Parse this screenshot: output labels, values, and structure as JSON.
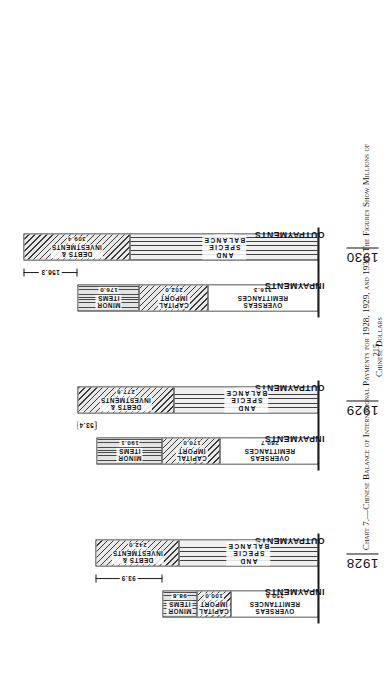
{
  "page": {
    "folio": "215",
    "caption_line1": "Chart 7.—Chinese Balance of International Payments for 1928, 1929, and 1930.  The Figures Show Millions of",
    "caption_line2": "Chinese Dollars"
  },
  "axis": {
    "inpayments_label": "INPAYMENTS",
    "outpayments_label": "OUTPAYMENTS"
  },
  "chart_data": {
    "type": "bar",
    "title": "Chinese Balance of International Payments for 1928, 1929, and 1930.  The Figures Show Millions of Chinese Dollars",
    "units": "Millions of Chinese Dollars",
    "xlabel": "",
    "ylabel": "",
    "grid": false,
    "legend": "none",
    "categories": [
      "1928",
      "1929",
      "1930"
    ],
    "groups": [
      {
        "year": "1928",
        "inpayments": {
          "label": "INPAYMENTS",
          "total": 450.2,
          "segments": [
            {
              "name": "OVERSEAS\nREMITTANCES",
              "value": "250.6",
              "amount": 250.6,
              "fill": "blank"
            },
            {
              "name": "CAPITAL\nIMPORT",
              "value": "100.0",
              "amount": 100.0,
              "fill": "hatch"
            },
            {
              "name": "MINOR\nITEMS",
              "value": "98.8",
              "amount": 98.8,
              "fill": "horz"
            }
          ]
        },
        "outpayments": {
          "label": "OUTPAYMENTS",
          "total": 643.3,
          "segments": [
            {
              "name": "TRADE AND SPECIE BALANCE",
              "value": "401.3",
              "amount": 401.3,
              "fill": "vert"
            },
            {
              "name": "DEBTS & INVESTMENTS",
              "value": "242.0",
              "amount": 242.0,
              "fill": "hatch"
            }
          ]
        },
        "deficit": "93.9"
      },
      {
        "year": "1929",
        "inpayments": {
          "label": "INPAYMENTS",
          "total": 640.8,
          "segments": [
            {
              "name": "OVERSEAS\nREMITTANCES",
              "value": "280.7",
              "amount": 280.7,
              "fill": "blank"
            },
            {
              "name": "CAPITAL\nIMPORT",
              "value": "170.0",
              "amount": 170.0,
              "fill": "hatch"
            },
            {
              "name": "MINOR\nITEMS",
              "value": "190.1",
              "amount": 190.1,
              "fill": "horz"
            }
          ]
        },
        "outpayments": {
          "label": "OUTPAYMENTS",
          "total": 694.2,
          "segments": [
            {
              "name": "TRADE AND SPECIE BALANCE",
              "value": "416.6",
              "amount": 416.6,
              "fill": "vert"
            },
            {
              "name": "DEBTS & INVESTMENTS",
              "value": "277.6",
              "amount": 277.6,
              "fill": "hatch"
            }
          ]
        },
        "deficit": "53.4"
      },
      {
        "year": "1930",
        "inpayments": {
          "label": "INPAYMENTS",
          "total": 694.3,
          "segments": [
            {
              "name": "OVERSEAS\nREMITTANCES",
              "value": "316.3",
              "amount": 316.3,
              "fill": "blank"
            },
            {
              "name": "CAPITAL\nIMPORT",
              "value": "202.0",
              "amount": 202.0,
              "fill": "hatch"
            },
            {
              "name": "MINOR\nITEMS",
              "value": "176.0",
              "amount": 176.0,
              "fill": "horz"
            }
          ]
        },
        "outpayments": {
          "label": "OUTPAYMENTS",
          "total": 850.6,
          "segments": [
            {
              "name": "TRADE AND SPECIE BALANCE",
              "value": "541.2",
              "amount": 541.2,
              "fill": "vert"
            },
            {
              "name": "DEBTS & INVESTMENTS",
              "value": "309.4",
              "amount": 309.4,
              "fill": "hatch"
            }
          ]
        },
        "deficit": "156.3"
      }
    ]
  }
}
